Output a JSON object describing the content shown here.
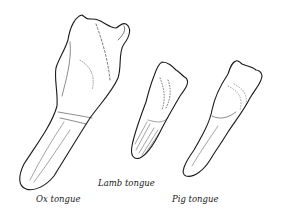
{
  "illustration": {
    "description": "Line drawing of three tongues",
    "ink_color": "#1a1a1a",
    "background": "#ffffff",
    "items": [
      {
        "name": "ox",
        "label": "Ox tongue"
      },
      {
        "name": "lamb",
        "label": "Lamb tongue"
      },
      {
        "name": "pig",
        "label": "Pig tongue"
      }
    ]
  }
}
